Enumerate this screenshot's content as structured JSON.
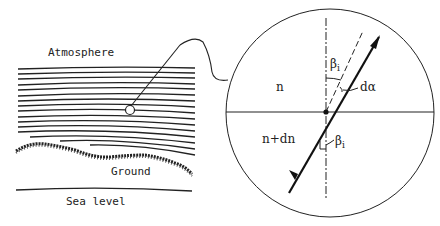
{
  "left_panel": {
    "atmosphere_label": "Atmosphere",
    "ground_label": "Ground",
    "sea_level_label": "Sea level"
  },
  "inset": {
    "upper_medium_label": "n",
    "lower_medium_label": "n+dn",
    "upper_angle_label": "β",
    "upper_angle_sub": "i",
    "lower_angle_label": "β",
    "lower_angle_sub": "i",
    "deflection_label": "dα"
  }
}
